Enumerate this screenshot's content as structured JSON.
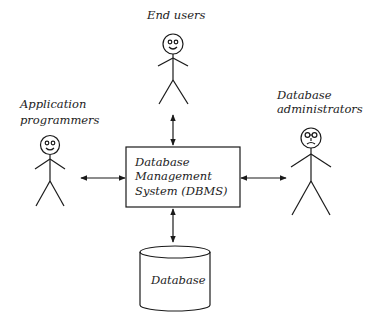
{
  "diagram": {
    "type": "dbms-actors",
    "nodes": {
      "end_users": {
        "label": "End users"
      },
      "app_programmers": {
        "label_line1": "Application",
        "label_line2": "programmers"
      },
      "db_admins": {
        "label_line1": "Database",
        "label_line2": "administrators"
      },
      "dbms": {
        "label_line1": "Database",
        "label_line2": "Management",
        "label_line3": "System (DBMS)"
      },
      "database": {
        "label": "Database"
      }
    },
    "edges": [
      {
        "from": "end_users",
        "to": "dbms",
        "style": "bidirectional-arrow"
      },
      {
        "from": "app_programmers",
        "to": "dbms",
        "style": "bidirectional-arrow"
      },
      {
        "from": "db_admins",
        "to": "dbms",
        "style": "bidirectional-arrow"
      },
      {
        "from": "dbms",
        "to": "database",
        "style": "bidirectional-arrow"
      }
    ],
    "colors": {
      "line": "#1a1a1a",
      "text": "#222222",
      "background": "#ffffff"
    }
  }
}
